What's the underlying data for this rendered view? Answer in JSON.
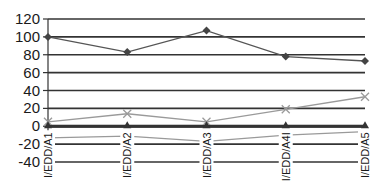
{
  "chart_data": {
    "type": "line",
    "title": "",
    "xlabel": "",
    "ylabel": "",
    "ylim": [
      -40,
      120
    ],
    "yticks": [
      120,
      100,
      80,
      60,
      40,
      20,
      0,
      -20,
      -40
    ],
    "grid": true,
    "legend": "none",
    "categories": [
      "I/EDD/A1",
      "I/EDD/A2",
      "I/EDD/A3",
      "I/EDD/A4I",
      "I/EDD/A5"
    ],
    "series": [
      {
        "name": "series-1",
        "marker": "diamond",
        "color": "#555555",
        "values": [
          100,
          83,
          107,
          78,
          73
        ]
      },
      {
        "name": "series-2",
        "marker": "x",
        "color": "#9a9a9a",
        "values": [
          5,
          14,
          5,
          19,
          33
        ]
      },
      {
        "name": "series-3",
        "marker": "triangle",
        "color": "#333333",
        "values": [
          0,
          0,
          0,
          0,
          0
        ]
      },
      {
        "name": "series-4",
        "marker": "none",
        "color": "#9a9a9a",
        "values": [
          -13,
          -11,
          -17,
          -10,
          -6
        ]
      }
    ]
  }
}
